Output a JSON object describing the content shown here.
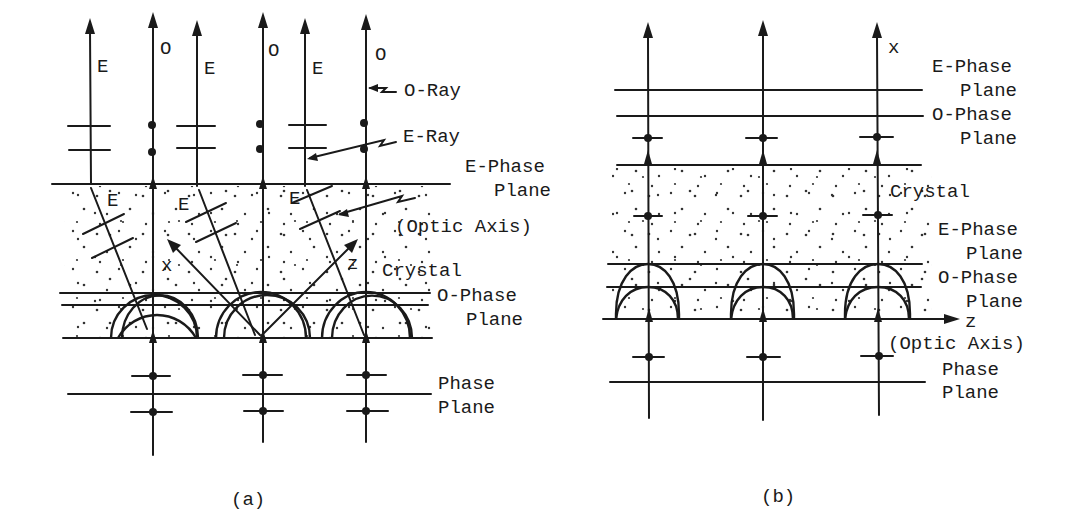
{
  "figure": {
    "panel_a": {
      "caption": "(a)",
      "ray_tags": [
        "E",
        "O",
        "E",
        "O",
        "E",
        "O"
      ],
      "crystal_ray_tags": [
        "E",
        "E",
        "E"
      ],
      "axis_x": "x",
      "axis_z": "z",
      "labels": {
        "o_ray": "O-Ray",
        "e_ray": "E-Ray",
        "e_phase_1": "E-Phase",
        "e_phase_2": "Plane",
        "optic_axis": "(Optic Axis)",
        "crystal": "Crystal",
        "o_phase_1": "O-Phase",
        "o_phase_2": "Plane",
        "phase_1": "Phase",
        "phase_2": "Plane"
      }
    },
    "panel_b": {
      "caption": "(b)",
      "axis_x": "x",
      "axis_z": "z",
      "labels": {
        "e_phase_top_1": "E-Phase",
        "e_phase_top_2": "Plane",
        "o_phase_top_1": "O-Phase",
        "o_phase_top_2": "Plane",
        "crystal": "Crystal",
        "e_phase_1": "E-Phase",
        "e_phase_2": "Plane",
        "o_phase_1": "O-Phase",
        "o_phase_2": "Plane",
        "optic_axis": "(Optic Axis)",
        "phase_1": "Phase",
        "phase_2": "Plane"
      }
    }
  }
}
